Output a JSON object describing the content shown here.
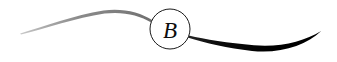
{
  "ornament": {
    "name": "swash-flourish-monogram",
    "width": 337,
    "height": 62,
    "background_color": "#ffffff",
    "monogram": {
      "letter": "B",
      "style": "italic-serif",
      "color": "#0d0d0d",
      "circle": {
        "center_x": 170,
        "center_y": 29,
        "radius": 20,
        "stroke_color": "#1a1a1a",
        "stroke_width": 1,
        "fill": "none"
      },
      "letter_x": 170,
      "letter_y": 37,
      "letter_font_size": 23
    },
    "strokes": [
      {
        "name": "left-gray-swash",
        "color": "#8a8a8a",
        "description": "thin light gray arc tapering from faint tip at left up over a crest then down into the circle",
        "start_x": 20,
        "start_y": 33,
        "crest_x": 103,
        "crest_y": 10,
        "end_x": 152,
        "end_y": 20,
        "max_thickness": 2.4
      },
      {
        "name": "right-black-swash",
        "color": "#000000",
        "description": "bold black swash exiting circle lower-right, dipping to a low belly then tapering to a fine point at upper right",
        "start_x": 188,
        "start_y": 38,
        "belly_x": 258,
        "belly_y": 51,
        "end_x": 321,
        "end_y": 31,
        "max_thickness": 6.5
      }
    ]
  }
}
